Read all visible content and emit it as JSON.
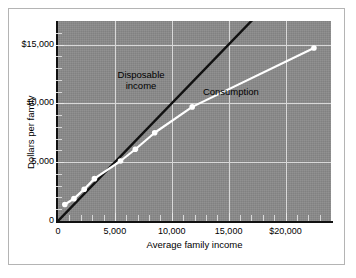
{
  "figure": {
    "background_color": "#ffffff",
    "border_color": "#b4b4b4",
    "plot_background_color": "#8a8a8a"
  },
  "chart_data": {
    "type": "line",
    "title": "",
    "xlabel": "Average family income",
    "ylabel": "Dollars per family",
    "xlim": [
      0,
      24000
    ],
    "ylim": [
      0,
      17000
    ],
    "grid": true,
    "legend_position": "inline-annotations",
    "xticks": [
      {
        "value": 0,
        "label": "0"
      },
      {
        "value": 5000,
        "label": "5,000"
      },
      {
        "value": 10000,
        "label": "10,000"
      },
      {
        "value": 15000,
        "label": "15,000"
      },
      {
        "value": 20000,
        "label": "$20,000"
      }
    ],
    "yticks": [
      {
        "value": 0,
        "label": "0"
      },
      {
        "value": 5000,
        "label": "5,000"
      },
      {
        "value": 10000,
        "label": "10,000"
      },
      {
        "value": 15000,
        "label": "$15,000"
      }
    ],
    "series": [
      {
        "name": "Disposable income",
        "style": "45-degree reference line",
        "color": "#111111",
        "markers": false,
        "x": [
          0,
          17800
        ],
        "y": [
          0,
          17800
        ]
      },
      {
        "name": "Consumption",
        "style": "line with round markers",
        "color": "#ffffff",
        "markers": true,
        "x": [
          600,
          1400,
          2300,
          3200,
          5500,
          6800,
          8500,
          11800,
          22500
        ],
        "y": [
          1400,
          1900,
          2700,
          3600,
          5100,
          6100,
          7500,
          9700,
          14700
        ]
      }
    ],
    "annotations": [
      {
        "text_line1": "Disposable",
        "text_line2": "income",
        "x": 7300,
        "y": 12900
      },
      {
        "text_line1": "Consumption",
        "text_line2": "",
        "x": 15200,
        "y": 11500
      }
    ]
  }
}
